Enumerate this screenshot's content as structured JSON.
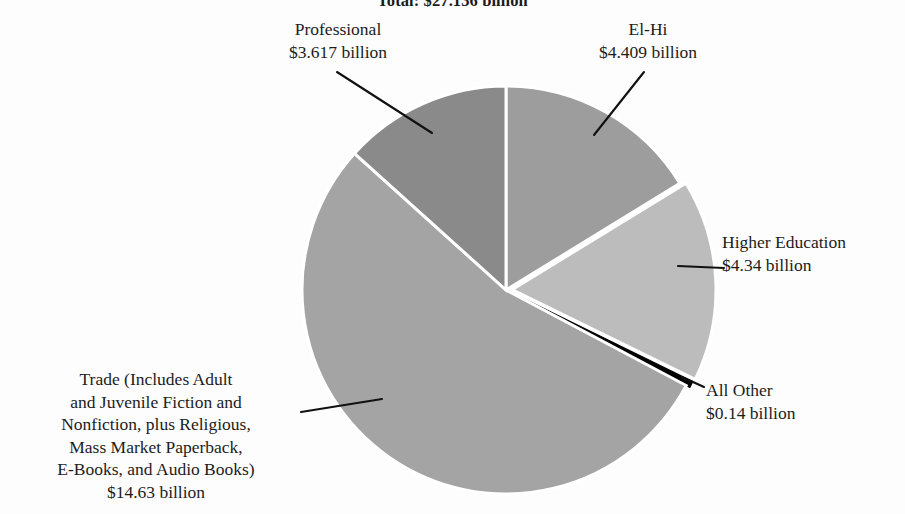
{
  "figure": {
    "title": "Total: $27.136 billion",
    "units": "billion US dollars"
  },
  "labels": {
    "professional": {
      "name": "Professional",
      "value_text": "$3.617 billion"
    },
    "elhi": {
      "name": "El-Hi",
      "value_text": "$4.409 billion"
    },
    "higher_education": {
      "name": "Higher Education",
      "value_text": "$4.34 billion"
    },
    "all_other": {
      "name": "All Other",
      "value_text": "$0.14 billion"
    },
    "trade": {
      "line1": "Trade (Includes Adult",
      "line2": "and Juvenile Fiction and",
      "line3": "Nonfiction, plus Religious,",
      "line4": "Mass Market Paperback,",
      "line5": "E-Books, and Audio Books)",
      "value_text": "$14.63 billion"
    }
  },
  "chart_data": {
    "type": "pie",
    "title": "Total: $27.136 billion",
    "xlabel": "",
    "ylabel": "",
    "unit": "billion USD",
    "total": 27.136,
    "start_angle_deg": 0,
    "direction": "clockwise",
    "legend": "none (direct labels with leader lines)",
    "grid": false,
    "categories": [
      "El-Hi",
      "Higher Education",
      "All Other",
      "Trade (Includes Adult and Juvenile Fiction and Nonfiction, plus Religious, Mass Market Paperback, E-Books, and Audio Books)",
      "Professional"
    ],
    "values": [
      4.409,
      4.34,
      0.14,
      14.63,
      3.617
    ],
    "value_labels": [
      "$4.409 billion",
      "$4.34 billion",
      "$0.14 billion",
      "$14.63 billion",
      "$3.617 billion"
    ],
    "percents": [
      16.25,
      16.0,
      0.52,
      53.91,
      13.33
    ],
    "colors": [
      "#9d9d9d",
      "#bcbcbc",
      "#000000",
      "#a4a4a4",
      "#8a8a8a"
    ],
    "slice_separator_color": "#ffffff",
    "exploded_slices": [
      "Higher Education",
      "All Other"
    ]
  },
  "geometry": {
    "center_x": 506,
    "center_y": 290,
    "radius": 204
  },
  "colors": {
    "background": "#fdfdfd",
    "text": "#1c1c1c",
    "leader_line": "#111111",
    "elhi": "#9d9d9d",
    "higher_education": "#bcbcbc",
    "all_other": "#000000",
    "trade": "#a4a4a4",
    "professional": "#8a8a8a",
    "separator": "#ffffff"
  },
  "leader_lines": {
    "professional": "from label down-right to Professional wedge",
    "elhi": "from label down-left to El-Hi wedge",
    "higher_education": "horizontal from label left into Higher Education wedge",
    "all_other": "short diagonal from label up-left to black sliver",
    "trade": "horizontal from label right into Trade wedge"
  }
}
